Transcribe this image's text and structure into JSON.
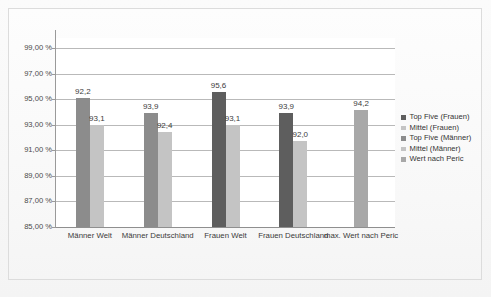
{
  "chart_data": {
    "type": "bar",
    "title": "",
    "subtitle": "",
    "xlabel": "",
    "ylabel": "",
    "ylim": [
      85.0,
      99.8
    ],
    "ytick_values": [
      85.0,
      87.0,
      89.0,
      91.0,
      93.0,
      95.0,
      97.0,
      99.0
    ],
    "ytick_labels": [
      "85,00 %",
      "87,00 %",
      "89,00 %",
      "91,00 %",
      "93,00 %",
      "95,00 %",
      "97,00 %",
      "99,00 %"
    ],
    "grid": true,
    "legend_position": "right",
    "categories": [
      "Männer Welt",
      "Männer Deutschland",
      "Frauen Welt",
      "Frauen Deutschland",
      "max. Wert nach Peric"
    ],
    "legend_entries": [
      "Top Five (Frauen)",
      "Mittel (Frauen)",
      "Top Five (Männer)",
      "Mittel (Männer)",
      "Wert nach Peric"
    ],
    "bars": [
      {
        "category": "Männer Welt",
        "series": "Top Five (Männer)",
        "value": 95.1,
        "label": "92,2",
        "color": "#8c8c8c"
      },
      {
        "category": "Männer Welt",
        "series": "Mittel (Männer)",
        "value": 92.95,
        "label": "93,1",
        "color": "#c4c4c4"
      },
      {
        "category": "Männer Deutschland",
        "series": "Top Five (Männer)",
        "value": 93.95,
        "label": "93,9",
        "color": "#8c8c8c"
      },
      {
        "category": "Männer Deutschland",
        "series": "Mittel (Männer)",
        "value": 92.45,
        "label": "92,4",
        "color": "#c4c4c4"
      },
      {
        "category": "Frauen Welt",
        "series": "Top Five (Frauen)",
        "value": 95.6,
        "label": "95,6",
        "color": "#5e5e5e"
      },
      {
        "category": "Frauen Welt",
        "series": "Mittel (Frauen)",
        "value": 92.95,
        "label": "93,1",
        "color": "#c4c4c4"
      },
      {
        "category": "Frauen Deutschland",
        "series": "Top Five (Frauen)",
        "value": 93.95,
        "label": "93,9",
        "color": "#5e5e5e"
      },
      {
        "category": "Frauen Deutschland",
        "series": "Mittel (Frauen)",
        "value": 91.75,
        "label": "92,0",
        "color": "#c4c4c4"
      },
      {
        "category": "max. Wert nach Peric",
        "series": "Wert nach Peric",
        "value": 94.2,
        "label": "94,2",
        "color": "#a8a8a8"
      }
    ],
    "colors": {
      "top_five_frauen": "#5e5e5e",
      "mittel_frauen": "#c4c4c4",
      "top_five_maenner": "#8c8c8c",
      "mittel_maenner": "#c4c4c4",
      "wert_nach_peric": "#a8a8a8",
      "gridline": "#b9b9b9",
      "axis": "#9a9a9a",
      "plot_background": "#ffffff",
      "figure_background": "#f7f7f7"
    }
  }
}
